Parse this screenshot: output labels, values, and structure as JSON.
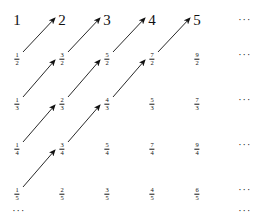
{
  "diagram": {
    "layout": {
      "col_x": [
        17,
        62,
        107,
        152,
        197,
        245
      ],
      "row_y": [
        20,
        55,
        100,
        145,
        190,
        212
      ]
    },
    "rows": [
      {
        "kind": "integer",
        "cells": [
          "1",
          "2",
          "3",
          "4",
          "5"
        ],
        "ellipsis": "···"
      },
      {
        "kind": "fraction",
        "cells": [
          {
            "num": "1",
            "den": "2"
          },
          {
            "num": "3",
            "den": "2"
          },
          {
            "num": "5",
            "den": "2"
          },
          {
            "num": "7",
            "den": "2"
          },
          {
            "num": "9",
            "den": "2"
          }
        ],
        "ellipsis": "···"
      },
      {
        "kind": "fraction",
        "cells": [
          {
            "num": "1",
            "den": "3"
          },
          {
            "num": "2",
            "den": "3"
          },
          {
            "num": "4",
            "den": "3"
          },
          {
            "num": "5",
            "den": "3"
          },
          {
            "num": "7",
            "den": "3"
          }
        ],
        "ellipsis": "···"
      },
      {
        "kind": "fraction",
        "cells": [
          {
            "num": "1",
            "den": "4"
          },
          {
            "num": "3",
            "den": "4"
          },
          {
            "num": "5",
            "den": "4"
          },
          {
            "num": "7",
            "den": "4"
          },
          {
            "num": "9",
            "den": "4"
          }
        ],
        "ellipsis": "···"
      },
      {
        "kind": "fraction",
        "cells": [
          {
            "num": "1",
            "den": "5"
          },
          {
            "num": "2",
            "den": "5"
          },
          {
            "num": "3",
            "den": "5"
          },
          {
            "num": "4",
            "den": "5"
          },
          {
            "num": "6",
            "den": "5"
          }
        ],
        "ellipsis": "···"
      }
    ],
    "bottom_row": {
      "left_ellipsis": "···",
      "right_ellipsis": "···"
    },
    "arrows": [
      {
        "from": [
          1,
          0
        ],
        "to": [
          0,
          1
        ]
      },
      {
        "from": [
          1,
          1
        ],
        "to": [
          0,
          2
        ]
      },
      {
        "from": [
          1,
          2
        ],
        "to": [
          0,
          3
        ]
      },
      {
        "from": [
          1,
          3
        ],
        "to": [
          0,
          4
        ]
      },
      {
        "from": [
          2,
          0
        ],
        "to": [
          1,
          1
        ]
      },
      {
        "from": [
          2,
          1
        ],
        "to": [
          1,
          2
        ]
      },
      {
        "from": [
          2,
          2
        ],
        "to": [
          1,
          3
        ]
      },
      {
        "from": [
          3,
          0
        ],
        "to": [
          2,
          1
        ]
      },
      {
        "from": [
          3,
          1
        ],
        "to": [
          2,
          2
        ]
      },
      {
        "from": [
          4,
          0
        ],
        "to": [
          3,
          1
        ]
      }
    ],
    "colors": {
      "ink": "#111111",
      "background": "#ffffff"
    }
  }
}
